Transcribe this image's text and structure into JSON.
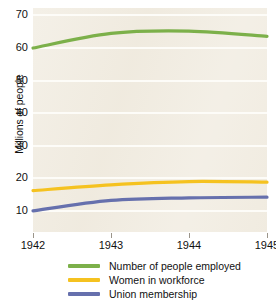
{
  "chart_data": {
    "type": "line",
    "title": "",
    "xlabel": "",
    "ylabel": "Millions of people",
    "x": [
      1942,
      1943,
      1944,
      1945
    ],
    "categories": [
      "1942",
      "1943",
      "1944",
      "1945"
    ],
    "xlim": [
      1942,
      1945
    ],
    "ylim": [
      3.5,
      72.3
    ],
    "y_ticks": [
      70,
      60,
      50,
      40,
      30,
      20,
      10
    ],
    "y_tick_labels": [
      "70",
      "60",
      "50",
      "40",
      "30",
      "20",
      "10"
    ],
    "x_ticks": [
      1942,
      1943,
      1944,
      1945
    ],
    "x_tick_labels": [
      "1942",
      "1943",
      "1944",
      "1945"
    ],
    "grid": "horizontal",
    "grid_color": "#fdfcf8",
    "plot_background": "#f1ece1",
    "legend_position": "bottom",
    "series": [
      {
        "name": "Number of people employed",
        "color": "#7cb04a",
        "values": [
          60.0,
          64.5,
          65.2,
          63.6
        ]
      },
      {
        "name": "Women in workforce",
        "color": "#f5c220",
        "values": [
          16.2,
          18.0,
          19.0,
          18.8
        ]
      },
      {
        "name": "Union membership",
        "color": "#6670ad",
        "values": [
          10.0,
          13.2,
          14.0,
          14.2
        ]
      }
    ]
  },
  "axes": {
    "y_title": "Millions of people",
    "y_labels": [
      "70",
      "60",
      "50",
      "40",
      "30",
      "20",
      "10"
    ],
    "x_labels": [
      "1942",
      "1943",
      "1944",
      "1945"
    ]
  },
  "legend": {
    "items": [
      {
        "label": "Number of people employed",
        "color": "#7cb04a"
      },
      {
        "label": "Women in workforce",
        "color": "#f5c220"
      },
      {
        "label": "Union membership",
        "color": "#6670ad"
      }
    ]
  }
}
